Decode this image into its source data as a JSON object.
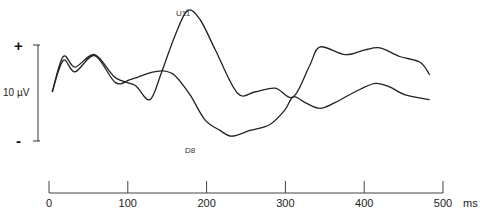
{
  "chart_data": {
    "type": "line",
    "title": "",
    "xlabel": "ms",
    "ylabel": "",
    "xlim": [
      0,
      500
    ],
    "x_ticks": [
      0,
      100,
      200,
      300,
      400,
      500
    ],
    "x_tick_labels": [
      "0",
      "100",
      "200",
      "300",
      "400",
      "500"
    ],
    "x_unit_label": "ms",
    "grid": false,
    "polarity": {
      "top": "+",
      "bottom": "-"
    },
    "scale_bar": {
      "label": "10 µV",
      "value_uV": 10
    },
    "series": [
      {
        "name": "U11",
        "label": "U11",
        "x": [
          4,
          18,
          33,
          58,
          84,
          109,
          128,
          143,
          160,
          176,
          192,
          211,
          239,
          261,
          287,
          310,
          331,
          344,
          376,
          401,
          420,
          445,
          471,
          483
        ],
        "y": [
          0.1,
          3.8,
          2.7,
          4.0,
          1.6,
          0.8,
          -0.7,
          2.2,
          6.0,
          8.6,
          7.6,
          4.5,
          0.0,
          0.1,
          0.5,
          -0.4,
          2.9,
          4.8,
          4.0,
          4.5,
          4.7,
          3.8,
          3.2,
          1.9
        ]
      },
      {
        "name": "D8",
        "label": "D8",
        "x": [
          4,
          18,
          33,
          58,
          84,
          103,
          128,
          145,
          160,
          179,
          198,
          217,
          232,
          255,
          280,
          299,
          310,
          325,
          344,
          363,
          388,
          414,
          433,
          452,
          483
        ],
        "y": [
          0.1,
          3.4,
          2.2,
          3.9,
          1.1,
          1.4,
          2.1,
          2.3,
          1.8,
          -0.2,
          -2.8,
          -3.9,
          -4.5,
          -3.9,
          -3.3,
          -1.8,
          -0.4,
          -1.0,
          -1.6,
          -1.0,
          0.1,
          1.0,
          0.6,
          -0.2,
          -0.7
        ]
      }
    ]
  }
}
